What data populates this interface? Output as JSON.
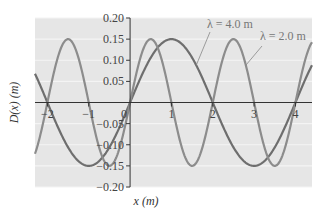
{
  "chart_data": {
    "type": "line",
    "title": "",
    "xlabel": "x (m)",
    "ylabel": "D(x) (m)",
    "xlim": [
      -2.3,
      4.4
    ],
    "ylim": [
      -0.2,
      0.2
    ],
    "grid": true,
    "x_ticks": [
      -2,
      -1,
      0,
      1,
      2,
      3,
      4
    ],
    "x_tick_labels": [
      "−2",
      "−1",
      "0",
      "1",
      "2",
      "3",
      "4"
    ],
    "y_ticks": [
      0.2,
      0.15,
      0.1,
      0.05,
      -0.05,
      -0.1,
      -0.15,
      -0.2
    ],
    "y_tick_labels": [
      "0.20",
      "0.15",
      "0.10",
      "0.05",
      "−0.05",
      "−0.10",
      "−0.15",
      "−0.20"
    ],
    "function": "D(x) = 0.15 sin(2πx/λ)",
    "amplitude": 0.15,
    "series": [
      {
        "name": "λ = 4.0 m",
        "wavelength": 4.0,
        "color": "#6e6e6e"
      },
      {
        "name": "λ = 2.0 m",
        "wavelength": 2.0,
        "color": "#8c8c8c"
      }
    ],
    "annotations": [
      {
        "text": "λ = 4.0 m",
        "target_series": 0,
        "at_x": 1.6
      },
      {
        "text": "λ = 2.0 m",
        "target_series": 1,
        "at_x": 2.8
      }
    ],
    "colors": {
      "background": "#e6e6e6",
      "gridline": "#f4f4f4",
      "axis": "#333333"
    }
  }
}
